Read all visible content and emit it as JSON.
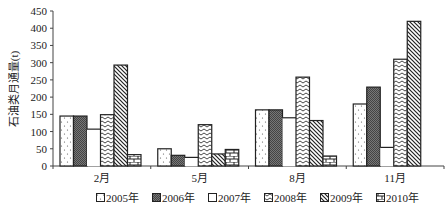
{
  "chart_data": {
    "type": "bar",
    "title": "",
    "xlabel": "",
    "ylabel": "石油类月通量(t)",
    "ylim": [
      0,
      450
    ],
    "yticks": [
      0,
      50,
      100,
      150,
      200,
      250,
      300,
      350,
      400,
      450
    ],
    "grid": false,
    "legend_position": "bottom",
    "categories": [
      "2月",
      "5月",
      "8月",
      "11月"
    ],
    "series": [
      {
        "name": "2005年",
        "pattern": "dots",
        "values": [
          145,
          50,
          163,
          180
        ]
      },
      {
        "name": "2006年",
        "pattern": "dark-crosshatch",
        "values": [
          145,
          31,
          163,
          229
        ]
      },
      {
        "name": "2007年",
        "pattern": "blank",
        "values": [
          107,
          25,
          140,
          54
        ]
      },
      {
        "name": "2008年",
        "pattern": "zigzag",
        "values": [
          149,
          120,
          258,
          310
        ]
      },
      {
        "name": "2009年",
        "pattern": "diagonal",
        "values": [
          293,
          35,
          132,
          420
        ]
      },
      {
        "name": "2010年",
        "pattern": "brick",
        "values": [
          33,
          48,
          29,
          0
        ]
      }
    ]
  },
  "legend": {
    "items": [
      "2005年",
      "2006年",
      "2007年",
      "2008年",
      "2009年",
      "2010年"
    ]
  }
}
